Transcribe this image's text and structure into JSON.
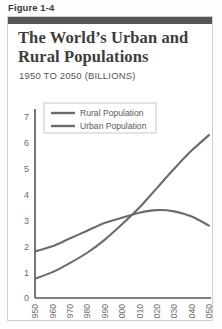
{
  "figure": {
    "label": "Figure 1-4"
  },
  "panel": {
    "title": "The World’s Urban and Rural Populations",
    "subtitle": "1950 TO 2050 (BILLIONS)"
  },
  "colors": {
    "rural": "#6b6b6b",
    "urban": "#6b6b6b",
    "axis": "#555555",
    "topbar": "#555555",
    "frame": "#cfcfcf",
    "text": "#4a4a4a"
  },
  "chart_data": {
    "type": "line",
    "title": "The World’s Urban and Rural Populations",
    "subtitle": "1950 TO 2050 (BILLIONS)",
    "xlabel": "",
    "ylabel": "",
    "units": "billions",
    "grid": false,
    "legend_position": "top-left",
    "x": [
      1950,
      1960,
      1970,
      1980,
      1990,
      2000,
      2010,
      2020,
      2030,
      2040,
      2050
    ],
    "categories": [
      "1950",
      "1960",
      "1970",
      "1980",
      "1990",
      "2000",
      "2010",
      "2020",
      "2030",
      "2040",
      "2050"
    ],
    "xlim": [
      1950,
      2050
    ],
    "ylim": [
      0,
      7
    ],
    "yticks": [
      0,
      1,
      2,
      3,
      4,
      5,
      6,
      7
    ],
    "series": [
      {
        "name": "Rural Population",
        "color": "#6b6b6b",
        "values": [
          1.8,
          2.0,
          2.3,
          2.6,
          2.9,
          3.1,
          3.3,
          3.4,
          3.35,
          3.15,
          2.8
        ]
      },
      {
        "name": "Urban Population",
        "color": "#6b6b6b",
        "values": [
          0.75,
          1.0,
          1.35,
          1.75,
          2.25,
          2.85,
          3.5,
          4.25,
          5.0,
          5.7,
          6.3
        ]
      }
    ],
    "annotations": [
      {
        "text": "crossover",
        "x": 2008,
        "y": 3.3
      }
    ]
  },
  "legend": {
    "items": [
      {
        "label": "Rural Population"
      },
      {
        "label": "Urban Population"
      }
    ]
  }
}
